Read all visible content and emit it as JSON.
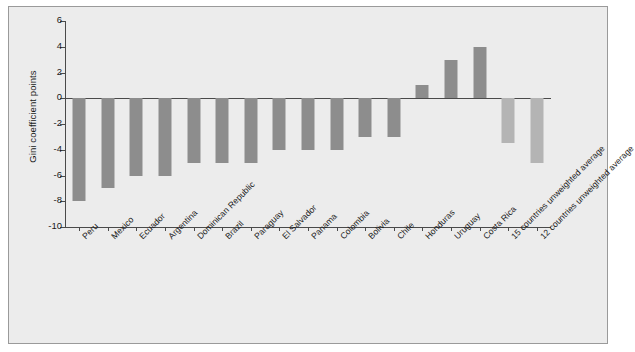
{
  "chart_data": {
    "type": "bar",
    "title": "",
    "xlabel": "",
    "ylabel": "Gini coefficient points",
    "ylim": [
      -10,
      6
    ],
    "ytick_step": 2,
    "yticks": [
      6,
      4,
      2,
      0,
      -2,
      -4,
      -6,
      -8,
      -10
    ],
    "ytick_labels": [
      "6",
      "4",
      "2",
      "0",
      "-2",
      "-4",
      "-6",
      "-8",
      "-10"
    ],
    "grid": false,
    "legend": "none",
    "zero_baseline": true,
    "categories": [
      "Peru",
      "Mexico",
      "Ecuador",
      "Argentina",
      "Dominican Republic",
      "Brazil",
      "Paraguay",
      "El Salvador",
      "Panama",
      "Colombia",
      "Bolivia",
      "Chile",
      "Honduras",
      "Uruguay",
      "Costa Rica",
      "15 countries unweighted average",
      "12 countries unweighted average"
    ],
    "values": [
      -8,
      -7,
      -6,
      -6,
      -5,
      -5,
      -5,
      -4,
      -4,
      -4,
      -3,
      -3,
      1,
      3,
      4,
      -3.5,
      -5
    ],
    "bar_kinds": [
      "country",
      "country",
      "country",
      "country",
      "country",
      "country",
      "country",
      "country",
      "country",
      "country",
      "country",
      "country",
      "country",
      "country",
      "country",
      "average",
      "average"
    ]
  },
  "colors": {
    "panel_background": "#ececec",
    "panel_border": "#9a9a9a",
    "axis": "#4a4a4a",
    "country_bar": "#8d8d8d",
    "average_bar": "#b4b4b4",
    "text": "#1a1a1a"
  }
}
